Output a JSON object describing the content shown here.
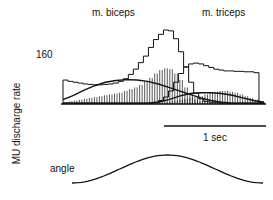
{
  "chart_data": {
    "type": "bar",
    "title": "",
    "panels": [
      "m. biceps",
      "m. triceps"
    ],
    "ylabel": "MU discharge rate",
    "y_tick": "160",
    "scale_bar": "1 sec",
    "angle_label": "angle",
    "x_bins": 40,
    "series": [
      {
        "name": "biceps outline (max)",
        "style": "step-line",
        "values": [
          55,
          52,
          50,
          48,
          46,
          45,
          44,
          44,
          45,
          46,
          48,
          52,
          58,
          68,
          80,
          95,
          110,
          130,
          148,
          160,
          170,
          168,
          150,
          120,
          85,
          50,
          25,
          12,
          6,
          4,
          3,
          2,
          2,
          2,
          2,
          2,
          2,
          2,
          2,
          2
        ]
      },
      {
        "name": "biceps mean (hatched)",
        "style": "hatched-bar",
        "values": [
          4,
          6,
          8,
          10,
          12,
          14,
          16,
          18,
          20,
          22,
          24,
          26,
          30,
          34,
          38,
          44,
          52,
          60,
          70,
          78,
          82,
          80,
          70,
          55,
          38,
          22,
          10,
          6,
          4,
          3,
          2,
          2,
          2,
          2,
          2,
          2,
          2,
          2,
          2,
          2
        ]
      },
      {
        "name": "triceps outline (max)",
        "style": "step-line",
        "values": [
          2,
          2,
          2,
          2,
          2,
          2,
          2,
          2,
          2,
          2,
          2,
          2,
          2,
          2,
          2,
          2,
          2,
          2,
          4,
          8,
          16,
          30,
          50,
          70,
          85,
          92,
          94,
          92,
          88,
          84,
          80,
          78,
          76,
          76,
          75,
          75,
          74,
          74,
          72,
          4
        ]
      },
      {
        "name": "triceps mean (hatched)",
        "style": "hatched-bar",
        "values": [
          2,
          2,
          2,
          2,
          2,
          2,
          2,
          2,
          2,
          2,
          2,
          2,
          2,
          2,
          2,
          2,
          2,
          2,
          2,
          3,
          4,
          6,
          8,
          10,
          12,
          14,
          16,
          18,
          22,
          26,
          28,
          30,
          30,
          28,
          26,
          22,
          18,
          14,
          10,
          6
        ]
      },
      {
        "name": "biceps smooth curve",
        "style": "line",
        "values": [
          10,
          20,
          32,
          42,
          50,
          54,
          56,
          55,
          52,
          46,
          38,
          30,
          22,
          14,
          8,
          4,
          2,
          2,
          2,
          2
        ]
      },
      {
        "name": "triceps smooth curve",
        "style": "line",
        "values": [
          2,
          2,
          2,
          2,
          2,
          2,
          2,
          2,
          2,
          4,
          10,
          18,
          24,
          26,
          26,
          24,
          20,
          14,
          8,
          4
        ]
      }
    ],
    "angle_trace": {
      "type": "line",
      "shape": "raised-cosine"
    }
  }
}
